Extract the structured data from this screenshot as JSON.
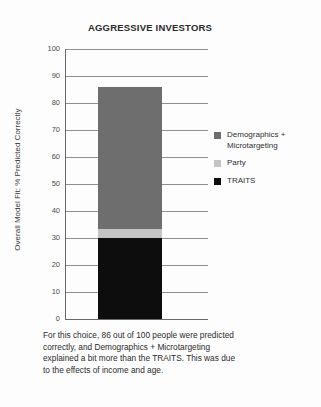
{
  "chart_data": {
    "type": "bar",
    "title": "AGGRESSIVE INVESTORS",
    "xlabel": "",
    "ylabel": "Overall Model Fit: % Predicted Correctly",
    "ylim": [
      0,
      100
    ],
    "grid": true,
    "stacked": true,
    "legend_position": "right",
    "categories": [
      "Aggressive Investors"
    ],
    "yticks": [
      "100",
      "90",
      "80",
      "70",
      "60",
      "50",
      "40",
      "30",
      "20",
      "10",
      "0"
    ],
    "series": [
      {
        "name": "Demographics + Microtargeting",
        "values": [
          52.5
        ],
        "color": "#6e6e6e"
      },
      {
        "name": "Party",
        "values": [
          3.5
        ],
        "color": "#c4c4c4"
      },
      {
        "name": "TRAITS",
        "values": [
          30
        ],
        "color": "#0d0d0d"
      }
    ],
    "total": 86,
    "annotation": "For this choice, 86 out of 100 people were predicted correctly, and Demographics + Microtargeting explained a bit more than the TRAITS. This was due to the effects of income and age."
  },
  "legend": {
    "items": [
      {
        "label": "Demographics + Microtargeting",
        "color": "#6e6e6e"
      },
      {
        "label": "Party",
        "color": "#c4c4c4"
      },
      {
        "label": "TRAITS",
        "color": "#0d0d0d"
      }
    ]
  },
  "caption": {
    "text": "For this choice, 86 out of 100 people were predicted correctly, and Demographics + Microtargeting explained a bit more than the TRAITS. This was due to the effects of income and age."
  }
}
